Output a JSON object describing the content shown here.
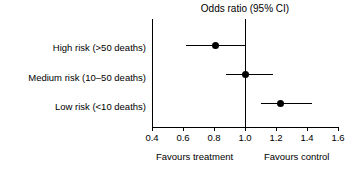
{
  "chart_data": {
    "type": "scatter",
    "subtype": "forest-plot",
    "title": "Odds ratio (95% CI)",
    "xlabel": "",
    "ylabel": "",
    "xlim": [
      0.4,
      1.6
    ],
    "xticks": [
      "0.4",
      "0.6",
      "0.8",
      "1.0",
      "1.2",
      "1.4",
      "1.6"
    ],
    "xtick_values": [
      0.4,
      0.6,
      0.8,
      1.0,
      1.2,
      1.4,
      1.6
    ],
    "grid": false,
    "legend": "none",
    "reference_line": 1.0,
    "categories": [
      "High risk (>50 deaths)",
      "Medium risk (10–50 deaths)",
      "Low risk (<10 deaths)"
    ],
    "rows": [
      {
        "label": "High risk (>50 deaths)",
        "estimate": 0.81,
        "ci_low": 0.62,
        "ci_high": 1.0
      },
      {
        "label": "Medium risk (10–50 deaths)",
        "estimate": 1.0,
        "ci_low": 0.88,
        "ci_high": 1.18
      },
      {
        "label": "Low risk (<10 deaths)",
        "estimate": 1.23,
        "ci_low": 1.1,
        "ci_high": 1.43
      }
    ],
    "footer_left": "Favours treatment",
    "footer_right": "Favours control",
    "colors": {
      "marker": "#000000",
      "line": "#000000",
      "axis": "#000000",
      "background": "#ffffff"
    }
  }
}
